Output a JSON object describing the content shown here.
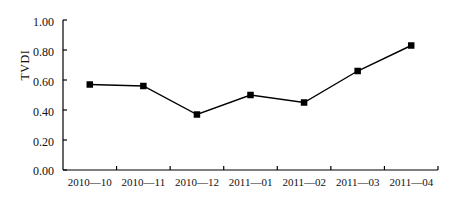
{
  "chart_data": {
    "type": "line",
    "title": "",
    "xlabel": "",
    "ylabel": "TVDI",
    "categories": [
      "2010—10",
      "2010—11",
      "2010—12",
      "2011—01",
      "2011—02",
      "2011—03",
      "2011—04"
    ],
    "values": [
      0.57,
      0.56,
      0.37,
      0.5,
      0.45,
      0.66,
      0.83
    ],
    "series": [
      {
        "name": "TVDI",
        "values": [
          0.57,
          0.56,
          0.37,
          0.5,
          0.45,
          0.66,
          0.83
        ]
      }
    ],
    "ylim": [
      0.0,
      1.0
    ],
    "yticks": [
      0.0,
      0.2,
      0.4,
      0.6,
      0.8,
      1.0
    ],
    "ytick_labels": [
      "0.00",
      "0.20",
      "0.40",
      "0.60",
      "0.80",
      "1.00"
    ],
    "grid": false,
    "legend": "none",
    "marker": "square",
    "line_color": "#000000",
    "marker_color": "#000000",
    "axis_color": "#000000"
  },
  "axis": {
    "y_title": "TVDI"
  }
}
